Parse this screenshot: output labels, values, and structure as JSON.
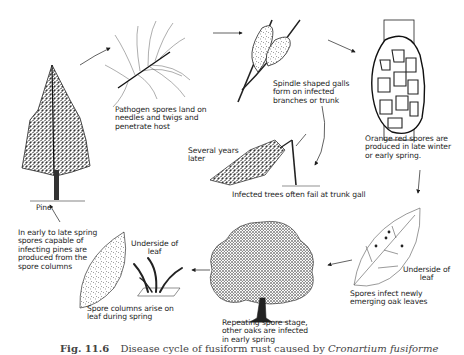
{
  "figure": {
    "title": "Disease cycle of fusiform rust",
    "caption": {
      "number": "Fig. 11.6",
      "text": "Disease cycle of fusiform rust caused by",
      "scientific_name": "Cronartium fusiforme"
    }
  },
  "stages": [
    {
      "id": "pine",
      "label": "Pine"
    },
    {
      "id": "needles",
      "label": "Pathogen spores land on\nneedles and twigs and\npenetrate host"
    },
    {
      "id": "galls",
      "label": "Spindle shaped galls\nform on infected\nbranches or trunk"
    },
    {
      "id": "orange-spores",
      "label": "Orange red spores are\nproduced in late winter\nor early spring."
    },
    {
      "id": "fallen-tree-time",
      "label": "Several years\nlater"
    },
    {
      "id": "fallen-tree",
      "label": "Infected trees often fail at trunk gall"
    },
    {
      "id": "oak-leaf-infect",
      "label": "Spores infect newly\nemerging oak leaves"
    },
    {
      "id": "oak-leaf-underside",
      "label": "Underside of\nleaf"
    },
    {
      "id": "oak-tree",
      "label": "Repeating spore stage,\nother oaks are infected\nin early spring"
    },
    {
      "id": "spore-columns",
      "label": "Spore columns arise on\nleaf during spring"
    },
    {
      "id": "spore-columns-underside",
      "label": "Underside of\nleaf"
    },
    {
      "id": "pine-infecting-spores",
      "label": "In early to late spring\nspores capable of\ninfecting pines are\nproduced from the\nspore columns"
    }
  ],
  "colors": {
    "ink": "#1e1e1e",
    "background": "#ffffff"
  }
}
